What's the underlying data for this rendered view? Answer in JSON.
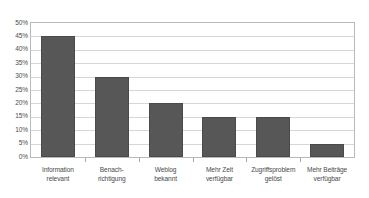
{
  "chart_data": {
    "type": "bar",
    "title": "",
    "subtitle": "",
    "xlabel": "",
    "ylabel": "",
    "categories": [
      "Information relevant",
      "Benach-richtigung",
      "Weblog bekannt",
      "Mehr Zeit verfügbar",
      "Zugriffsproblem gelöst",
      "Mehr Beiträge verfügbar"
    ],
    "category_lines": [
      [
        "Information",
        "relevant"
      ],
      [
        "Benach-",
        "richtigung"
      ],
      [
        "Weblog",
        "bekannt"
      ],
      [
        "Mehr Zeit",
        "verfügbar"
      ],
      [
        "Zugriffsproblem",
        "gelöst"
      ],
      [
        "Mehr Beiträge",
        "verfügbar"
      ]
    ],
    "values": [
      45,
      30,
      20,
      14.8,
      14.8,
      4.7
    ],
    "ylim": [
      0,
      50
    ],
    "ytick_step": 5,
    "ytick_labels": [
      "50%",
      "45%",
      "40%",
      "35%",
      "30%",
      "25%",
      "20%",
      "15%",
      "10%",
      "5%",
      "0%"
    ],
    "ytick_values": [
      50,
      45,
      40,
      35,
      30,
      25,
      20,
      15,
      10,
      5,
      0
    ],
    "grid": true,
    "legend": false,
    "legend_position": "none",
    "bar_color": "#575757",
    "bar_border_color": "#4a4a4a",
    "gridline_color": "#d6d6d6",
    "frame_color": "#b9b9b9",
    "background_color": "#ffffff",
    "text_color": "#4a4a4a"
  }
}
